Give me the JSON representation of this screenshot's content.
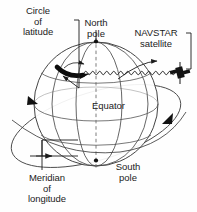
{
  "figure": {
    "background_color": "#fefefe",
    "line_color": "#3a3a3a",
    "text_color": "#1b1b1b"
  },
  "labels": {
    "circle_of_latitude": "Circle\nof\nlatitude",
    "circle_of_latitude_line1": "Circle",
    "circle_of_latitude_line2": "of",
    "circle_of_latitude_line3": "latitude",
    "north_pole_line1": "North",
    "north_pole_line2": "pole",
    "navstar_line1": "NAVSTAR",
    "navstar_line2": "satellite",
    "equator": "Equator",
    "south_pole_line1": "South",
    "south_pole_line2": "pole",
    "meridian_line1": "Meridian",
    "meridian_line2": "of",
    "meridian_line3": "longitude"
  },
  "diagram": {
    "globe": {
      "center_x": 96,
      "center_y": 104,
      "radius_x": 62,
      "radius_y": 62,
      "meridian_count": 4,
      "parallel_count": 3
    },
    "polar_axis": {
      "style": "dashed",
      "north_pole_point": [
        96,
        41
      ],
      "south_pole_point": [
        96,
        161
      ]
    },
    "satellite": {
      "name": "NAVSTAR satellite",
      "x": 180,
      "y": 72
    },
    "signal": {
      "type": "wavy-line",
      "from_x": 84,
      "to_x": 178,
      "y": 73,
      "amplitude": 2.4,
      "wavelength": 7
    },
    "orbit": {
      "type": "tilted-ellipse",
      "arrowheads": 3
    },
    "highlighted_latitude": {
      "description": "thick black arc marking a circle of latitude",
      "x": 70,
      "y": 70
    }
  }
}
